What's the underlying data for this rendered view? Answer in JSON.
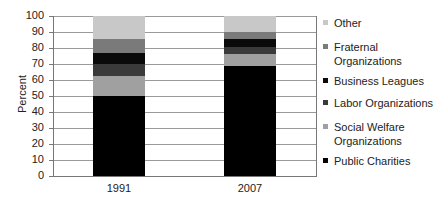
{
  "chart_data": {
    "type": "bar",
    "stacked": true,
    "title": "",
    "xlabel": "",
    "ylabel": "Percent",
    "ylim": [
      0,
      100
    ],
    "yticks": [
      "0",
      "10",
      "20",
      "30",
      "40",
      "50",
      "60",
      "70",
      "80",
      "90",
      "100"
    ],
    "grid": true,
    "legend_position": "right",
    "categories": [
      "1991",
      "2007"
    ],
    "series": [
      {
        "name": "Public Charities",
        "color": "#000000",
        "values": [
          50,
          69
        ]
      },
      {
        "name": "Social Welfare Organizations",
        "color": "#a0a0a0",
        "values": [
          12.5,
          7.5
        ]
      },
      {
        "name": "Labor Organizations",
        "color": "#3a3a3a",
        "values": [
          7.5,
          4
        ]
      },
      {
        "name": "Business Leagues",
        "color": "#0a0a0a",
        "values": [
          7,
          5
        ]
      },
      {
        "name": "Fraternal Organizations",
        "color": "#7a7a7a",
        "values": [
          8.5,
          4.5
        ]
      },
      {
        "name": "Other",
        "color": "#c8c8c8",
        "values": [
          14.5,
          10
        ]
      }
    ]
  },
  "legend": [
    {
      "label": "Other",
      "color": "#c8c8c8"
    },
    {
      "label": "Fraternal\nOrganizations",
      "color": "#7a7a7a"
    },
    {
      "label": "Business Leagues",
      "color": "#0a0a0a"
    },
    {
      "label": "Labor Organizations",
      "color": "#3a3a3a"
    },
    {
      "label": "Social Welfare\nOrganizations",
      "color": "#a0a0a0"
    },
    {
      "label": "Public Charities",
      "color": "#000000"
    }
  ]
}
